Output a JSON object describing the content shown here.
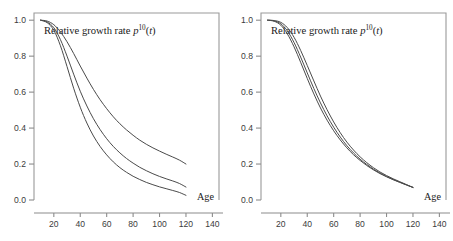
{
  "figure": {
    "background": "#ffffff",
    "panel_count": 2
  },
  "chart_data": [
    {
      "type": "line",
      "panel": "left",
      "title": "Relative growth rate p^10(t)",
      "title_parts": {
        "text": "Relative growth rate ",
        "symbol": "p",
        "superscript": "10",
        "argument": "(t)"
      },
      "xlabel": "Age",
      "ylabel": "",
      "xlim": [
        5,
        145
      ],
      "ylim": [
        0.0,
        1.04
      ],
      "xticks": [
        20,
        40,
        60,
        80,
        100,
        120,
        140
      ],
      "yticks": [
        0.0,
        0.2,
        0.4,
        0.6,
        0.8,
        1.0
      ],
      "xticklabels": [
        "20",
        "40",
        "60",
        "80",
        "100",
        "120",
        "140"
      ],
      "yticklabels": [
        "0.0",
        "0.2",
        "0.4",
        "0.6",
        "0.8",
        "1.0"
      ],
      "grid": false,
      "legend": null,
      "line_color": "#4a4a4a",
      "x": [
        10,
        15,
        20,
        25,
        30,
        35,
        40,
        45,
        50,
        55,
        60,
        65,
        70,
        75,
        80,
        85,
        90,
        95,
        100,
        105,
        110,
        115,
        120
      ],
      "series": [
        {
          "name": "curve-upper",
          "values": [
            1.0,
            0.995,
            0.975,
            0.935,
            0.88,
            0.815,
            0.745,
            0.678,
            0.615,
            0.558,
            0.508,
            0.463,
            0.424,
            0.39,
            0.36,
            0.333,
            0.31,
            0.29,
            0.272,
            0.255,
            0.239,
            0.222,
            0.2
          ]
        },
        {
          "name": "curve-middle",
          "values": [
            1.0,
            0.99,
            0.958,
            0.892,
            0.8,
            0.7,
            0.605,
            0.523,
            0.452,
            0.392,
            0.341,
            0.298,
            0.262,
            0.231,
            0.205,
            0.182,
            0.163,
            0.146,
            0.131,
            0.118,
            0.106,
            0.092,
            0.072
          ]
        },
        {
          "name": "curve-lower",
          "values": [
            1.0,
            0.986,
            0.944,
            0.858,
            0.742,
            0.622,
            0.516,
            0.428,
            0.356,
            0.298,
            0.251,
            0.212,
            0.18,
            0.154,
            0.132,
            0.114,
            0.098,
            0.085,
            0.073,
            0.063,
            0.053,
            0.042,
            0.026
          ]
        }
      ]
    },
    {
      "type": "line",
      "panel": "right",
      "title": "Relative growth rate p^10(t)",
      "title_parts": {
        "text": "Relative growth rate ",
        "symbol": "p",
        "superscript": "10",
        "argument": "(t)"
      },
      "xlabel": "Age",
      "ylabel": "",
      "xlim": [
        5,
        145
      ],
      "ylim": [
        0.0,
        1.04
      ],
      "xticks": [
        20,
        40,
        60,
        80,
        100,
        120,
        140
      ],
      "yticks": [
        0.0,
        0.2,
        0.4,
        0.6,
        0.8,
        1.0
      ],
      "xticklabels": [
        "20",
        "40",
        "60",
        "80",
        "100",
        "120",
        "140"
      ],
      "yticklabels": [
        "0.0",
        "0.2",
        "0.4",
        "0.6",
        "0.8",
        "1.0"
      ],
      "grid": false,
      "legend": null,
      "line_color": "#4a4a4a",
      "x": [
        10,
        15,
        20,
        25,
        30,
        35,
        40,
        45,
        50,
        55,
        60,
        65,
        70,
        75,
        80,
        85,
        90,
        95,
        100,
        105,
        110,
        115,
        120
      ],
      "series": [
        {
          "name": "curve-outer",
          "values": [
            1.0,
            0.998,
            0.988,
            0.958,
            0.905,
            0.832,
            0.748,
            0.662,
            0.578,
            0.502,
            0.434,
            0.374,
            0.322,
            0.278,
            0.24,
            0.208,
            0.18,
            0.156,
            0.136,
            0.118,
            0.102,
            0.086,
            0.07
          ]
        },
        {
          "name": "curve-mid",
          "values": [
            1.0,
            0.996,
            0.98,
            0.94,
            0.876,
            0.795,
            0.707,
            0.62,
            0.54,
            0.468,
            0.405,
            0.35,
            0.302,
            0.262,
            0.227,
            0.198,
            0.172,
            0.15,
            0.131,
            0.114,
            0.099,
            0.084,
            0.07
          ]
        },
        {
          "name": "curve-inner",
          "values": [
            1.0,
            0.994,
            0.972,
            0.923,
            0.852,
            0.766,
            0.676,
            0.59,
            0.512,
            0.444,
            0.385,
            0.334,
            0.29,
            0.252,
            0.22,
            0.192,
            0.168,
            0.147,
            0.129,
            0.113,
            0.098,
            0.084,
            0.07
          ]
        }
      ]
    }
  ]
}
